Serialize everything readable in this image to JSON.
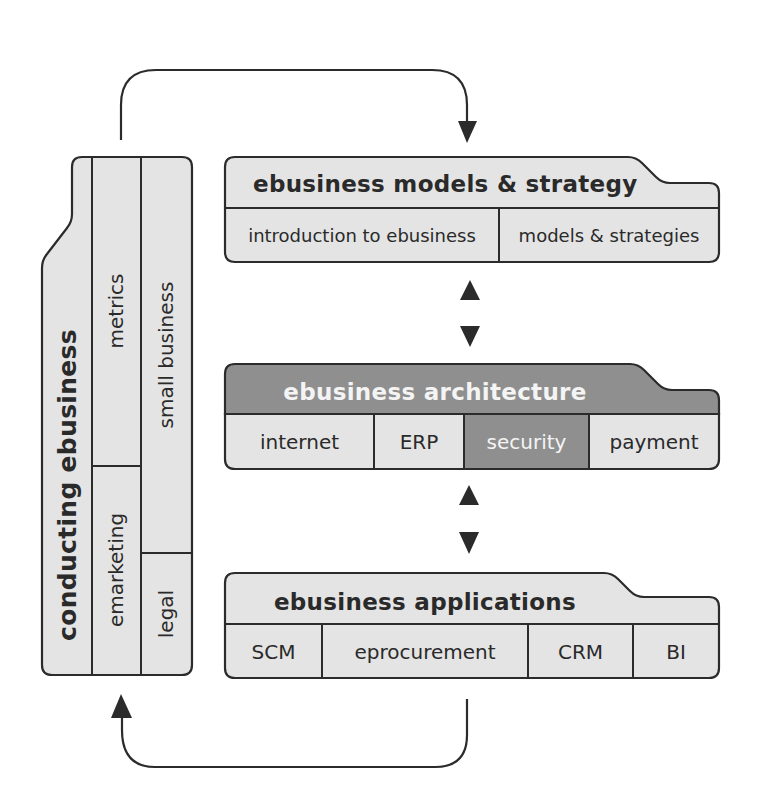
{
  "colors": {
    "light_fill": "#e4e4e4",
    "dark_fill": "#8f8f8f",
    "stroke": "#2b2b2b",
    "text_dark": "#2a2a2a",
    "text_light": "#f4f4f4"
  },
  "layers": {
    "strategy": {
      "title": "ebusiness models & strategy",
      "cells": [
        "introduction to ebusiness",
        "models & strategies"
      ]
    },
    "architecture": {
      "title": "ebusiness architecture",
      "cells": [
        "internet",
        "ERP",
        "security",
        "payment"
      ],
      "highlighted_cell": "security"
    },
    "applications": {
      "title": "ebusiness applications",
      "cells": [
        "SCM",
        "eprocurement",
        "CRM",
        "BI"
      ]
    }
  },
  "side_panel": {
    "title": "conducting ebusiness",
    "cells": [
      "metrics",
      "emarketing",
      "small business",
      "legal"
    ]
  },
  "connectors": {
    "top_arc": "side-panel-to-strategy-arrow",
    "bottom_arc": "applications-to-side-panel-arrow",
    "bidirectional_1": "strategy-architecture-arrows",
    "bidirectional_2": "architecture-applications-arrows"
  }
}
